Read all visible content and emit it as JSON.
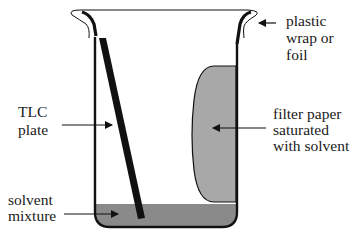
{
  "diagram": {
    "labels": {
      "tlc_plate": [
        "TLC",
        "plate"
      ],
      "solvent_mixture": [
        "solvent",
        "mixture"
      ],
      "plastic_wrap": [
        "plastic",
        "wrap or",
        "foil"
      ],
      "filter_paper": [
        "filter paper",
        "saturated",
        "with solvent"
      ]
    },
    "colors": {
      "outline": "#111111",
      "solvent": "#8a8a8a",
      "filter_paper": "#a8a8a8",
      "tlc_plate": "#111111",
      "background": "#ffffff"
    }
  }
}
